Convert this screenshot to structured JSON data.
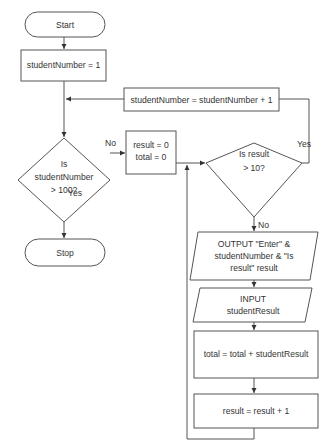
{
  "diagram": {
    "type": "flowchart",
    "nodes": {
      "start": {
        "kind": "terminator",
        "label": "Start"
      },
      "init_student": {
        "kind": "process",
        "label": "studentNumber = 1"
      },
      "increment_student": {
        "kind": "process",
        "label": "studentNumber = studentNumber + 1"
      },
      "decision_student": {
        "kind": "decision",
        "lines": [
          "Is",
          "studentNumber",
          "> 100?"
        ]
      },
      "init_result_total": {
        "kind": "process",
        "lines": [
          "result = 0",
          "total = 0"
        ]
      },
      "decision_result": {
        "kind": "decision",
        "lines": [
          "Is result",
          "> 10?"
        ]
      },
      "stop": {
        "kind": "terminator",
        "label": "Stop"
      },
      "output_prompt": {
        "kind": "io",
        "lines": [
          "OUTPUT \"Enter\" &",
          "studentNumber & \"Is",
          "result\" result"
        ]
      },
      "input_result": {
        "kind": "io",
        "lines": [
          "INPUT",
          "studentResult"
        ]
      },
      "accumulate_total": {
        "kind": "process",
        "label": "total = total + studentResult"
      },
      "increment_result": {
        "kind": "process",
        "label": "result = result + 1"
      }
    },
    "edge_labels": {
      "student_no": "No",
      "student_yes": "Yes",
      "result_yes": "Yes",
      "result_no": "No"
    },
    "edges": [
      {
        "from": "start",
        "to": "init_student"
      },
      {
        "from": "init_student",
        "to": "decision_student"
      },
      {
        "from": "increment_student",
        "to": "decision_student"
      },
      {
        "from": "decision_student",
        "to": "init_result_total",
        "label": "No"
      },
      {
        "from": "decision_student",
        "to": "stop",
        "label": "Yes"
      },
      {
        "from": "init_result_total",
        "to": "decision_result"
      },
      {
        "from": "decision_result",
        "to": "increment_student",
        "label": "Yes"
      },
      {
        "from": "decision_result",
        "to": "output_prompt",
        "label": "No"
      },
      {
        "from": "output_prompt",
        "to": "input_result"
      },
      {
        "from": "input_result",
        "to": "accumulate_total"
      },
      {
        "from": "accumulate_total",
        "to": "increment_result"
      },
      {
        "from": "increment_result",
        "to": "decision_result"
      }
    ]
  }
}
